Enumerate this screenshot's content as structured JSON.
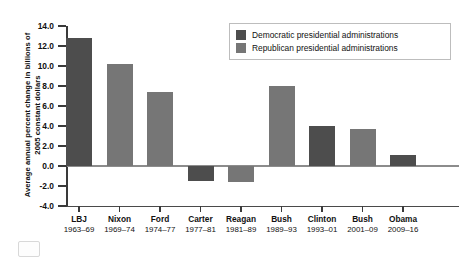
{
  "chart_data": {
    "type": "bar",
    "title": "",
    "xlabel": "",
    "ylabel": "Average annual percent change in billions of\n2005 constant dollars",
    "ylim": [
      -4.0,
      14.0
    ],
    "ytick_labels": [
      "14.0",
      "12.0",
      "10.0",
      "8.0",
      "6.0",
      "4.0",
      "2.0",
      "0.0",
      "-2.0",
      "-4.0"
    ],
    "ytick_values": [
      14.0,
      12.0,
      10.0,
      8.0,
      6.0,
      4.0,
      2.0,
      0.0,
      -2.0,
      -4.0
    ],
    "grid": false,
    "legend_position": "top-right",
    "categories": [
      "LBJ",
      "Nixon",
      "Ford",
      "Carter",
      "Reagan",
      "Bush",
      "Clinton",
      "Bush",
      "Obama"
    ],
    "category_years": [
      "1963–69",
      "1969–74",
      "1974–77",
      "1977–81",
      "1981–89",
      "1989–93",
      "1993–01",
      "2001–09",
      "2009–16"
    ],
    "values": [
      12.8,
      10.2,
      7.4,
      -1.5,
      -1.6,
      8.0,
      4.0,
      3.7,
      1.1
    ],
    "party": [
      "dem",
      "rep",
      "rep",
      "dem",
      "rep",
      "rep",
      "dem",
      "rep",
      "dem"
    ],
    "legend": [
      {
        "key": "dem",
        "label": "Democratic presidential administrations",
        "color": "#4d4d4d"
      },
      {
        "key": "rep",
        "label": "Republican presidential administrations",
        "color": "#767676"
      }
    ],
    "colors": {
      "democratic": "#4d4d4d",
      "republican": "#767676",
      "axis": "#3a3a3a",
      "zero_line": "#8c8c8c"
    }
  }
}
